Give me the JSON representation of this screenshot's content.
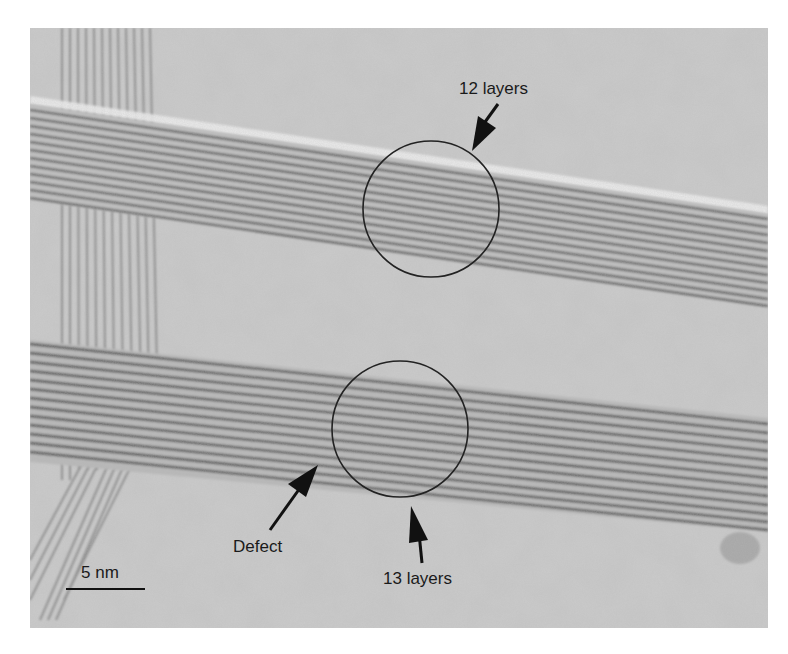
{
  "figure": {
    "type": "TEM micrograph",
    "background_color": "#ffffff",
    "micrograph_tone": "#c9c9c9",
    "fringe_dark": "#4a4a4a",
    "annotation_color": "#111111"
  },
  "annotations": {
    "upper_label": "12 layers",
    "lower_label": "13 layers",
    "defect_label": "Defect"
  },
  "scale_bar": {
    "label": "5 nm",
    "length_px": 78
  },
  "circles": [
    {
      "name": "upper-circle",
      "cx": 431,
      "cy": 209,
      "r": 68
    },
    {
      "name": "lower-circle",
      "cx": 400,
      "cy": 429,
      "r": 68
    }
  ]
}
